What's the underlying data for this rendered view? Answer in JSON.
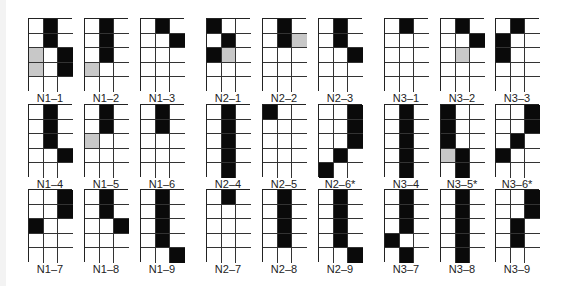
{
  "title": "",
  "legend": {
    "black": "#0a0a0a",
    "gray": "#c8c8c8",
    "white": "#ffffff"
  },
  "panels": [
    {
      "label": "N1–1",
      "x": 28,
      "y": 18,
      "cells": [
        [
          0,
          1,
          0
        ],
        [
          0,
          1,
          0
        ],
        [
          2,
          0,
          1
        ],
        [
          2,
          0,
          1
        ],
        [
          0,
          0,
          0
        ]
      ]
    },
    {
      "label": "N1–2",
      "x": 84,
      "y": 18,
      "cells": [
        [
          0,
          1,
          0
        ],
        [
          0,
          1,
          0
        ],
        [
          0,
          1,
          0
        ],
        [
          2,
          0,
          0
        ],
        [
          0,
          0,
          0
        ]
      ]
    },
    {
      "label": "N1–3",
      "x": 140,
      "y": 18,
      "cells": [
        [
          0,
          1,
          0
        ],
        [
          0,
          0,
          1
        ],
        [
          0,
          0,
          0
        ],
        [
          0,
          0,
          0
        ],
        [
          0,
          0,
          0
        ]
      ]
    },
    {
      "label": "N2–1",
      "x": 206,
      "y": 18,
      "cells": [
        [
          1,
          0,
          0
        ],
        [
          0,
          1,
          0
        ],
        [
          1,
          2,
          0
        ],
        [
          0,
          0,
          0
        ],
        [
          0,
          0,
          0
        ]
      ]
    },
    {
      "label": "N2–2",
      "x": 262,
      "y": 18,
      "cells": [
        [
          0,
          1,
          0
        ],
        [
          0,
          1,
          2
        ],
        [
          0,
          0,
          0
        ],
        [
          0,
          0,
          0
        ],
        [
          0,
          0,
          0
        ]
      ]
    },
    {
      "label": "N2–3",
      "x": 318,
      "y": 18,
      "cells": [
        [
          0,
          1,
          0
        ],
        [
          0,
          1,
          0
        ],
        [
          0,
          0,
          1
        ],
        [
          0,
          0,
          0
        ],
        [
          0,
          0,
          0
        ]
      ]
    },
    {
      "label": "N3–1",
      "x": 384,
      "y": 18,
      "cells": [
        [
          0,
          1,
          0
        ],
        [
          0,
          0,
          0
        ],
        [
          0,
          0,
          0
        ],
        [
          0,
          0,
          0
        ],
        [
          0,
          0,
          0
        ]
      ]
    },
    {
      "label": "N3–2",
      "x": 440,
      "y": 18,
      "cells": [
        [
          0,
          1,
          0
        ],
        [
          0,
          0,
          1
        ],
        [
          0,
          2,
          0
        ],
        [
          0,
          0,
          0
        ],
        [
          0,
          0,
          0
        ]
      ]
    },
    {
      "label": "N3–3",
      "x": 495,
      "y": 18,
      "cells": [
        [
          0,
          1,
          0
        ],
        [
          1,
          0,
          0
        ],
        [
          1,
          0,
          0
        ],
        [
          0,
          0,
          0
        ],
        [
          0,
          0,
          0
        ]
      ]
    },
    {
      "label": "N1–4",
      "x": 28,
      "y": 104,
      "cells": [
        [
          0,
          1,
          0
        ],
        [
          0,
          1,
          0
        ],
        [
          0,
          1,
          0
        ],
        [
          0,
          0,
          1
        ],
        [
          0,
          0,
          0
        ]
      ]
    },
    {
      "label": "N1–5",
      "x": 84,
      "y": 104,
      "cells": [
        [
          0,
          1,
          0
        ],
        [
          0,
          1,
          0
        ],
        [
          2,
          0,
          0
        ],
        [
          0,
          0,
          0
        ],
        [
          0,
          0,
          0
        ]
      ]
    },
    {
      "label": "N1–6",
      "x": 140,
      "y": 104,
      "cells": [
        [
          0,
          1,
          0
        ],
        [
          0,
          1,
          0
        ],
        [
          0,
          0,
          0
        ],
        [
          0,
          0,
          0
        ],
        [
          0,
          0,
          0
        ]
      ]
    },
    {
      "label": "N2–4",
      "x": 206,
      "y": 104,
      "cells": [
        [
          0,
          1,
          0
        ],
        [
          0,
          1,
          0
        ],
        [
          0,
          1,
          0
        ],
        [
          0,
          1,
          0
        ],
        [
          0,
          1,
          0
        ]
      ]
    },
    {
      "label": "N2–5",
      "x": 262,
      "y": 104,
      "cells": [
        [
          1,
          0,
          0
        ],
        [
          0,
          0,
          0
        ],
        [
          0,
          0,
          0
        ],
        [
          0,
          0,
          0
        ],
        [
          0,
          0,
          0
        ]
      ]
    },
    {
      "label": "N2–6*",
      "x": 318,
      "y": 104,
      "cells": [
        [
          0,
          0,
          1
        ],
        [
          0,
          0,
          1
        ],
        [
          0,
          0,
          1
        ],
        [
          0,
          1,
          0
        ],
        [
          1,
          0,
          0
        ]
      ]
    },
    {
      "label": "N3–4",
      "x": 384,
      "y": 104,
      "cells": [
        [
          0,
          1,
          0
        ],
        [
          0,
          1,
          0
        ],
        [
          0,
          1,
          0
        ],
        [
          0,
          1,
          0
        ],
        [
          0,
          1,
          0
        ]
      ]
    },
    {
      "label": "N3–5*",
      "x": 440,
      "y": 104,
      "cells": [
        [
          1,
          0,
          0
        ],
        [
          1,
          0,
          0
        ],
        [
          1,
          0,
          0
        ],
        [
          2,
          1,
          0
        ],
        [
          0,
          1,
          0
        ]
      ]
    },
    {
      "label": "N3–6*",
      "x": 495,
      "y": 104,
      "cells": [
        [
          0,
          0,
          1
        ],
        [
          0,
          0,
          1
        ],
        [
          0,
          1,
          0
        ],
        [
          1,
          0,
          0
        ],
        [
          0,
          0,
          0
        ]
      ]
    },
    {
      "label": "N1–7",
      "x": 28,
      "y": 189,
      "cells": [
        [
          0,
          0,
          1
        ],
        [
          0,
          0,
          1
        ],
        [
          1,
          0,
          0
        ],
        [
          0,
          0,
          0
        ],
        [
          0,
          0,
          0
        ]
      ]
    },
    {
      "label": "N1–8",
      "x": 84,
      "y": 189,
      "cells": [
        [
          0,
          1,
          0
        ],
        [
          0,
          1,
          0
        ],
        [
          0,
          0,
          1
        ],
        [
          0,
          0,
          0
        ],
        [
          0,
          0,
          0
        ]
      ]
    },
    {
      "label": "N1–9",
      "x": 140,
      "y": 189,
      "cells": [
        [
          0,
          1,
          0
        ],
        [
          0,
          1,
          0
        ],
        [
          0,
          1,
          0
        ],
        [
          0,
          1,
          0
        ],
        [
          0,
          0,
          1
        ]
      ]
    },
    {
      "label": "N2–7",
      "x": 206,
      "y": 189,
      "cells": [
        [
          0,
          1,
          0
        ],
        [
          0,
          0,
          0
        ],
        [
          0,
          0,
          0
        ],
        [
          0,
          0,
          0
        ],
        [
          0,
          0,
          0
        ]
      ]
    },
    {
      "label": "N2–8",
      "x": 262,
      "y": 189,
      "cells": [
        [
          0,
          1,
          0
        ],
        [
          0,
          1,
          0
        ],
        [
          0,
          1,
          0
        ],
        [
          0,
          1,
          0
        ],
        [
          0,
          0,
          0
        ]
      ]
    },
    {
      "label": "N2–9",
      "x": 318,
      "y": 189,
      "cells": [
        [
          0,
          1,
          0
        ],
        [
          0,
          1,
          0
        ],
        [
          0,
          1,
          0
        ],
        [
          0,
          1,
          0
        ],
        [
          0,
          0,
          1
        ]
      ]
    },
    {
      "label": "N3–7",
      "x": 384,
      "y": 189,
      "cells": [
        [
          0,
          1,
          0
        ],
        [
          0,
          1,
          0
        ],
        [
          0,
          1,
          0
        ],
        [
          1,
          0,
          0
        ],
        [
          0,
          1,
          0
        ]
      ]
    },
    {
      "label": "N3–8",
      "x": 440,
      "y": 189,
      "cells": [
        [
          0,
          1,
          0
        ],
        [
          0,
          1,
          0
        ],
        [
          0,
          1,
          0
        ],
        [
          0,
          1,
          0
        ],
        [
          0,
          1,
          0
        ]
      ]
    },
    {
      "label": "N3–9",
      "x": 495,
      "y": 189,
      "cells": [
        [
          0,
          0,
          1
        ],
        [
          0,
          0,
          1
        ],
        [
          0,
          1,
          0
        ],
        [
          0,
          1,
          0
        ],
        [
          0,
          0,
          0
        ]
      ]
    }
  ]
}
